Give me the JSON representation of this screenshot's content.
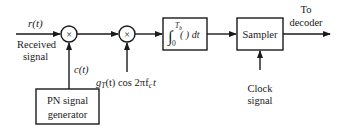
{
  "diagram": {
    "input": {
      "signal": "r(t)",
      "label_line1": "Received",
      "label_line2": "signal"
    },
    "mixer1": {
      "symbol": "×"
    },
    "mixer2": {
      "symbol": "×"
    },
    "spreading_code": {
      "signal": "c(t)"
    },
    "carrier": {
      "g": "g",
      "g_sub": "T",
      "expr": "(t) cos 2πf",
      "fc_sub": "c",
      "t": "t"
    },
    "integrator": {
      "upper": "T",
      "upper_sub": "b",
      "lower": "0",
      "body": "( ) dt",
      "integral_sign": "∫"
    },
    "sampler": {
      "label": "Sampler"
    },
    "output": {
      "line1": "To",
      "line2": "decoder"
    },
    "pn_generator": {
      "line1": "PN signal",
      "line2": "generator"
    },
    "clock": {
      "line1": "Clock",
      "line2": "signal"
    }
  }
}
